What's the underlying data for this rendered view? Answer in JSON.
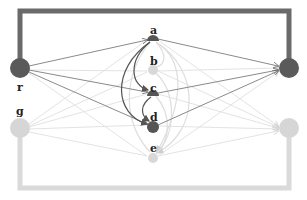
{
  "diagram": {
    "type": "bipartite-flow-graph",
    "colors": {
      "dark": "#5a5a5a",
      "light": "#d6d6d6",
      "dark_edge": "#6e6e6e",
      "light_edge": "#e2e2e2",
      "label": "#222222"
    },
    "nodes": [
      {
        "id": "r",
        "label": "r",
        "x": 20,
        "y": 68,
        "r": 10,
        "tone": "dark"
      },
      {
        "id": "g",
        "label": "g",
        "x": 20,
        "y": 128,
        "r": 10,
        "tone": "light"
      },
      {
        "id": "a",
        "label": "a",
        "x": 153,
        "y": 38,
        "r": 5,
        "tone": "dark"
      },
      {
        "id": "b",
        "label": "b",
        "x": 153,
        "y": 70,
        "r": 5,
        "tone": "light"
      },
      {
        "id": "c",
        "label": "c",
        "x": 153,
        "y": 93,
        "r": 5,
        "tone": "dark"
      },
      {
        "id": "d",
        "label": "d",
        "x": 153,
        "y": 126,
        "r": 6,
        "tone": "dark"
      },
      {
        "id": "e",
        "label": "e",
        "x": 153,
        "y": 157,
        "r": 5,
        "tone": "light"
      },
      {
        "id": "out_dark",
        "label": "",
        "x": 289,
        "y": 68,
        "r": 10,
        "tone": "dark"
      },
      {
        "id": "out_light",
        "label": "",
        "x": 289,
        "y": 128,
        "r": 10,
        "tone": "light"
      }
    ],
    "labels": {
      "r": "r",
      "g": "g",
      "a": "a",
      "b": "b",
      "c": "c",
      "d": "d",
      "e": "e"
    }
  }
}
